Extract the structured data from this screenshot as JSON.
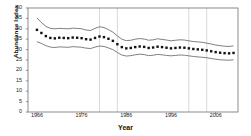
{
  "chart_data": {
    "type": "line",
    "title": "",
    "xlabel": "Year",
    "ylabel": "Abundance Index",
    "xlim": [
      1964,
      2011
    ],
    "ylim": [
      0,
      50
    ],
    "ytick_labels": [
      "0",
      "5",
      "10",
      "15",
      "20",
      "25",
      "30",
      "35",
      "40",
      "45",
      "50"
    ],
    "ytick_values": [
      0,
      5,
      10,
      15,
      20,
      25,
      30,
      35,
      40,
      45,
      50
    ],
    "xtick_labels": [
      "1966",
      "1976",
      "1986",
      "1996",
      "2006"
    ],
    "xtick_values": [
      1966,
      1976,
      1986,
      1996,
      2006
    ],
    "grid": false,
    "legend": "none",
    "marker": "filled-square",
    "reference_lines_x": [
      1980,
      1984,
      2000,
      2004
    ],
    "series": [
      {
        "name": "Abundance Index",
        "style": "points",
        "x": [
          1966,
          1967,
          1968,
          1969,
          1970,
          1971,
          1972,
          1973,
          1974,
          1975,
          1976,
          1977,
          1978,
          1979,
          1980,
          1981,
          1982,
          1983,
          1984,
          1985,
          1986,
          1987,
          1988,
          1989,
          1990,
          1991,
          1992,
          1993,
          1994,
          1995,
          1996,
          1997,
          1998,
          1999,
          2000,
          2001,
          2002,
          2003,
          2004,
          2005,
          2006,
          2007,
          2008,
          2009,
          2010
        ],
        "values": [
          39.5,
          38.0,
          36.5,
          35.6,
          35.4,
          35.7,
          35.6,
          35.5,
          35.8,
          35.7,
          35.5,
          35.0,
          34.8,
          35.6,
          36.3,
          36.0,
          35.2,
          34.2,
          32.6,
          31.2,
          30.6,
          30.8,
          31.2,
          31.5,
          31.3,
          30.8,
          31.0,
          31.4,
          31.2,
          30.9,
          30.6,
          30.8,
          31.0,
          30.9,
          30.6,
          30.3,
          30.1,
          29.9,
          29.6,
          29.2,
          28.8,
          28.5,
          28.3,
          28.2,
          28.4
        ]
      },
      {
        "name": "Upper confidence limit",
        "style": "line",
        "x": [
          1966,
          1967,
          1968,
          1969,
          1970,
          1971,
          1972,
          1973,
          1974,
          1975,
          1976,
          1977,
          1978,
          1979,
          1980,
          1981,
          1982,
          1983,
          1984,
          1985,
          1986,
          1987,
          1988,
          1989,
          1990,
          1991,
          1992,
          1993,
          1994,
          1995,
          1996,
          1997,
          1998,
          1999,
          2000,
          2001,
          2002,
          2003,
          2004,
          2005,
          2006,
          2007,
          2008,
          2009,
          2010
        ],
        "values": [
          45.2,
          43.0,
          41.2,
          40.2,
          40.0,
          40.2,
          40.1,
          40.0,
          40.3,
          40.2,
          40.0,
          39.4,
          39.2,
          40.2,
          41.0,
          40.6,
          39.6,
          38.4,
          36.6,
          35.0,
          34.3,
          34.5,
          35.0,
          35.3,
          35.1,
          34.5,
          34.7,
          35.2,
          34.9,
          34.6,
          34.2,
          34.5,
          34.7,
          34.6,
          34.2,
          33.9,
          33.7,
          33.5,
          33.1,
          32.7,
          32.2,
          31.9,
          31.6,
          31.5,
          31.8
        ]
      },
      {
        "name": "Lower confidence limit",
        "style": "line",
        "x": [
          1966,
          1967,
          1968,
          1969,
          1970,
          1971,
          1972,
          1973,
          1974,
          1975,
          1976,
          1977,
          1978,
          1979,
          1980,
          1981,
          1982,
          1983,
          1984,
          1985,
          1986,
          1987,
          1988,
          1989,
          1990,
          1991,
          1992,
          1993,
          1994,
          1995,
          1996,
          1997,
          1998,
          1999,
          2000,
          2001,
          2002,
          2003,
          2004,
          2005,
          2006,
          2007,
          2008,
          2009,
          2010
        ],
        "values": [
          33.8,
          33.0,
          31.9,
          31.2,
          31.0,
          31.3,
          31.2,
          31.1,
          31.4,
          31.3,
          31.1,
          30.7,
          30.5,
          31.2,
          31.7,
          31.5,
          30.8,
          30.0,
          28.6,
          27.4,
          26.9,
          27.1,
          27.5,
          27.8,
          27.6,
          27.1,
          27.3,
          27.7,
          27.5,
          27.2,
          27.0,
          27.2,
          27.4,
          27.3,
          27.0,
          26.7,
          26.5,
          26.3,
          26.1,
          25.7,
          25.4,
          25.1,
          25.0,
          24.9,
          25.1
        ]
      }
    ]
  }
}
